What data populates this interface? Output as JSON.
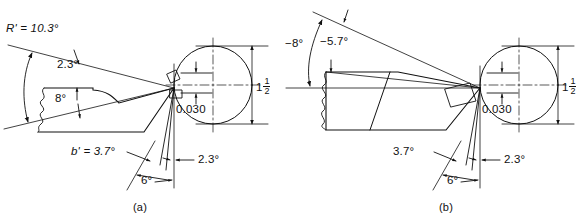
{
  "figure": {
    "background_color": "#ffffff",
    "line_color": "#111111"
  },
  "panels": [
    {
      "id": "a",
      "caption": "(a)",
      "labels": {
        "rake_arc": "R' = 10.3°",
        "back_rake": "2.3°",
        "relief": "8°",
        "side_rake": "b' = 3.7°",
        "end_relief": "6°",
        "side_angle": "2.3°",
        "nose_offset": "0.030",
        "work_dia_whole": "1",
        "work_dia_num": "1",
        "work_dia_den": "2"
      }
    },
    {
      "id": "b",
      "caption": "(b)",
      "labels": {
        "neg_back_rake": "−8°",
        "neg_side_rake": "−5.7°",
        "side_rake": "3.7°",
        "end_relief": "6°",
        "side_angle": "2.3°",
        "nose_offset": "0.030",
        "work_dia_whole": "1",
        "work_dia_num": "1",
        "work_dia_den": "2"
      }
    }
  ]
}
